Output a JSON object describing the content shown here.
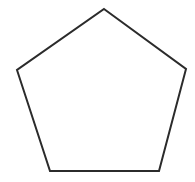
{
  "canvas": {
    "width": 195,
    "height": 182,
    "background_color": "#ffffff",
    "title": "Pentagon"
  },
  "shape": {
    "name": "pentagon",
    "sides": 5,
    "type": "regular-polygon",
    "fill_color": "#ffffff",
    "stroke_color": "#2b2b2b",
    "stroke_width": 2,
    "points": "104,9 186,69 159,171 50,171 17,70",
    "vertices": [
      {
        "label": "apex",
        "x": 104,
        "y": 9
      },
      {
        "label": "right",
        "x": 186,
        "y": 69
      },
      {
        "label": "bottom-right",
        "x": 159,
        "y": 171
      },
      {
        "label": "bottom-left",
        "x": 50,
        "y": 171
      },
      {
        "label": "left",
        "x": 17,
        "y": 70
      }
    ]
  }
}
